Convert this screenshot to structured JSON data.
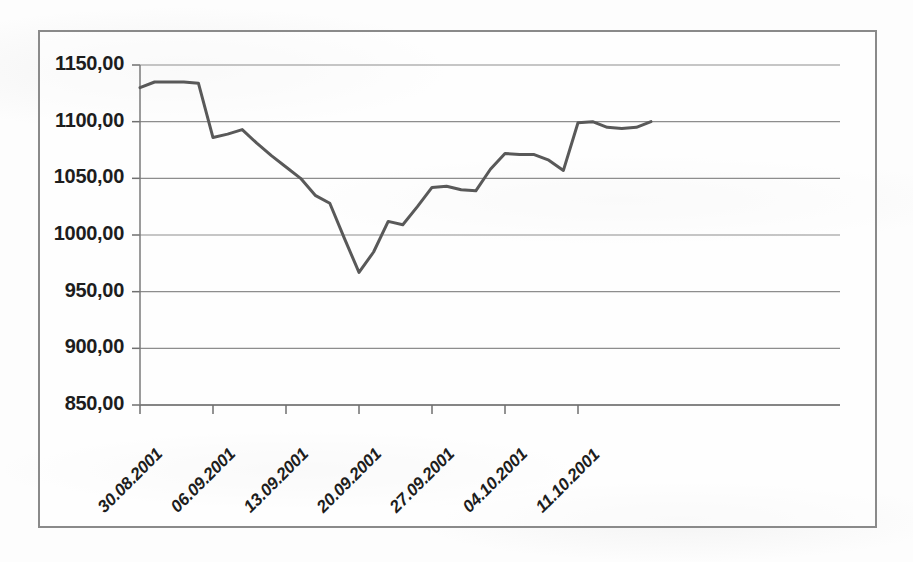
{
  "chart_data": {
    "type": "line",
    "title": "",
    "subtitle": "",
    "xlabel": "",
    "ylabel": "",
    "grid": true,
    "legend": false,
    "legend_position": "none",
    "decimal_separator": ",",
    "ylim": [
      850,
      1150
    ],
    "yticks": [
      1150,
      1100,
      1050,
      1000,
      950,
      900,
      850
    ],
    "ytick_labels": [
      "1150,00",
      "1100,00",
      "1050,00",
      "1000,00",
      "950,00",
      "900,00",
      "850,00"
    ],
    "xticks": [
      "30.08.2001",
      "06.09.2001",
      "13.09.2001",
      "20.09.2001",
      "27.09.2001",
      "04.10.2001",
      "11.10.2001"
    ],
    "xtick_labels": [
      "30.08.2001",
      "06.09.2001",
      "13.09.2001",
      "20.09.2001",
      "27.09.2001",
      "04.10.2001",
      "11.10.2001"
    ],
    "xlim": [
      "30.08.2001",
      "18.10.2001"
    ],
    "line_color": "#595959",
    "line_width": 3,
    "series": [
      {
        "name": "Index",
        "x": [
          "30.08.2001",
          "31.08.2001",
          "03.09.2001",
          "04.09.2001",
          "05.09.2001",
          "06.09.2001",
          "07.09.2001",
          "10.09.2001",
          "11.09.2001",
          "12.09.2001",
          "13.09.2001",
          "14.09.2001",
          "17.09.2001",
          "18.09.2001",
          "19.09.2001",
          "20.09.2001",
          "21.09.2001",
          "24.09.2001",
          "25.09.2001",
          "26.09.2001",
          "27.09.2001",
          "28.09.2001",
          "01.10.2001",
          "02.10.2001",
          "03.10.2001",
          "04.10.2001",
          "05.10.2001",
          "08.10.2001",
          "09.10.2001",
          "10.10.2001",
          "11.10.2001",
          "12.10.2001",
          "15.10.2001",
          "16.10.2001",
          "17.10.2001",
          "18.10.2001"
        ],
        "values": [
          1130,
          1135,
          1135,
          1135,
          1134,
          1086,
          1089,
          1093,
          1081,
          1070,
          1060,
          1050,
          1035,
          1028,
          997,
          967,
          985,
          1012,
          1009,
          1025,
          1042,
          1043,
          1040,
          1039,
          1058,
          1072,
          1071,
          1071,
          1066,
          1057,
          1099,
          1100,
          1095,
          1094,
          1095,
          1100
        ]
      }
    ],
    "notes": {
      "min_value": 967,
      "min_label": "20.09.2001",
      "max_value": 1135,
      "max_label": "31.08.2001",
      "start_value": 1130,
      "end_value": 1100
    }
  },
  "axes": {
    "y_axis_name": "value-axis",
    "x_axis_name": "date-axis"
  }
}
